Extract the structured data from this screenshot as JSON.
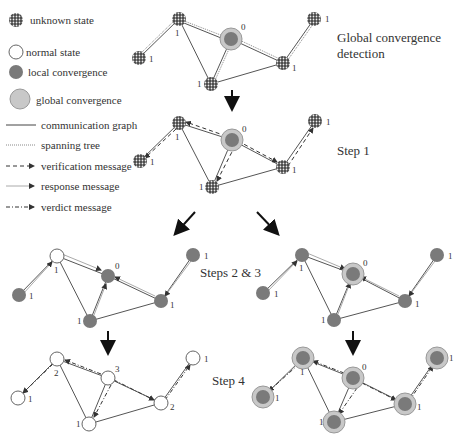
{
  "legend": {
    "unknown_state": "unknown state",
    "normal_state": "normal state",
    "local_convergence": "local convergence",
    "global_convergence": "global convergence",
    "communication_graph": "communication graph",
    "spanning_tree": "spanning tree",
    "verification_message": "verification message",
    "response_message": "response message",
    "verdict_message": "verdict message"
  },
  "steps": {
    "global_detection_line1": "Global convergence",
    "global_detection_line2": "detection",
    "step1": "Step 1",
    "steps23": "Steps 2 & 3",
    "step4": "Step 4"
  },
  "panels": {
    "p0": {
      "A": "1",
      "C": "0",
      "TR": "1",
      "R": "1",
      "B": "1",
      "L": "1"
    },
    "p1": {
      "A": "1",
      "C": "0",
      "TR": "1",
      "R": "1",
      "B": "1",
      "L": "1"
    },
    "p2": {
      "A": "1",
      "C": "0",
      "TR": "1",
      "R": "1",
      "B": "1",
      "L": "1"
    },
    "p3": {
      "A": "1",
      "C": "0",
      "TR": "1",
      "R": "1",
      "B": "1",
      "L": "1"
    },
    "p4": {
      "A": "2",
      "C": "3",
      "TR": "1",
      "R": "2",
      "B": "1",
      "L": "1"
    },
    "p5": {
      "A": "1",
      "C": "0",
      "TR": "1",
      "R": "1",
      "B": "1",
      "L": "1"
    }
  },
  "colors": {
    "local": "#7a7a7a",
    "global_ring": "#c8c8c8",
    "edge": "#555555"
  }
}
